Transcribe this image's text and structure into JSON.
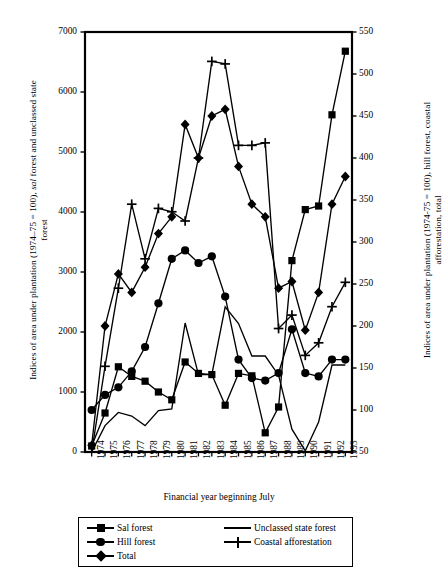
{
  "chart_data": {
    "type": "line",
    "title": "",
    "xlabel": "Financial year beginning July",
    "ylabel": "Indices of area under plantation (1974–75 = 100), sal forest and unclassed state forest",
    "ylabel_right": "Indices of area under plantation (1974–75 = 100), hill forest, coastal afforestation, total",
    "categories": [
      "1974",
      "1975",
      "1976",
      "1977",
      "1978",
      "1979",
      "1980",
      "1981",
      "1982",
      "1983",
      "1984",
      "1985",
      "1986",
      "1987",
      "1988",
      "1989",
      "1990",
      "1991",
      "1992",
      "1993"
    ],
    "ylim": [
      0,
      7000
    ],
    "yticks": [
      0,
      1000,
      2000,
      3000,
      4000,
      5000,
      6000,
      7000
    ],
    "ylim_right": [
      50,
      550
    ],
    "yticks_right": [
      50,
      100,
      150,
      200,
      250,
      300,
      350,
      400,
      450,
      500,
      550
    ],
    "grid": false,
    "legend_position": "bottom",
    "series": [
      {
        "name": "Sal forest",
        "axis": "left",
        "marker": "square",
        "values": [
          100,
          650,
          1420,
          1260,
          1180,
          1000,
          870,
          1500,
          1310,
          1290,
          780,
          1310,
          1270,
          320,
          750,
          3190,
          4040,
          4100,
          5620,
          6680
        ]
      },
      {
        "name": "Hill forest",
        "axis": "right",
        "marker": "circle",
        "values": [
          100,
          118,
          127,
          146,
          175,
          227,
          280,
          290,
          275,
          283,
          235,
          160,
          138,
          135,
          144,
          196,
          144,
          140,
          160,
          160
        ]
      },
      {
        "name": "Total",
        "axis": "right",
        "marker": "diamond",
        "values": [
          58,
          200,
          262,
          240,
          270,
          310,
          330,
          440,
          400,
          450,
          458,
          390,
          345,
          330,
          245,
          253,
          195,
          240,
          345,
          378
        ]
      },
      {
        "name": "Unclassed state forest",
        "axis": "left",
        "marker": "none",
        "values": [
          0,
          440,
          660,
          600,
          440,
          690,
          720,
          2150,
          1290,
          1290,
          2420,
          2140,
          1600,
          1600,
          1280,
          380,
          20,
          500,
          1450,
          1450
        ]
      },
      {
        "name": "Coastal afforestation",
        "axis": "right",
        "marker": "plus",
        "values": [
          50,
          152,
          245,
          345,
          280,
          340,
          336,
          325,
          400,
          515,
          512,
          415,
          415,
          418,
          197,
          213,
          165,
          180,
          223,
          252
        ]
      }
    ]
  },
  "legend": {
    "items": [
      {
        "label": "Sal forest",
        "marker": "square"
      },
      {
        "label": "Hill forest",
        "marker": "circle"
      },
      {
        "label": "Total",
        "marker": "diamond"
      },
      {
        "label": "Unclassed state forest",
        "marker": "none"
      },
      {
        "label": "Coastal afforestation",
        "marker": "plus"
      }
    ]
  },
  "axis_left": {
    "title_part1": "Indices of area under plantation (1974–75 = 100), ",
    "title_italic": "sal",
    "title_part2": " forest and unclassed state forest"
  },
  "axis_right": {
    "title": "Indices of area under plantation (1974-75 = 100), hill forest, coastal afforestation, total"
  },
  "axis_x": {
    "title": "Financial year beginning July"
  }
}
